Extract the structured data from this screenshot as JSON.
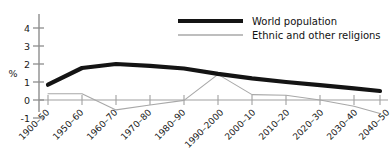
{
  "chart_data": {
    "type": "line",
    "title": "",
    "subtitle": "",
    "xlabel": "",
    "ylabel": "%",
    "categories": [
      "1900–50",
      "1950–60",
      "1960–70",
      "1970–80",
      "1980–90",
      "1990–2000",
      "2000–10",
      "2010–20",
      "2020–30",
      "2030–40",
      "2040–50"
    ],
    "series": [
      {
        "name": "World population",
        "color": "#141414",
        "line_width": 4.2,
        "values": [
          0.85,
          1.78,
          2.0,
          1.9,
          1.75,
          1.45,
          1.2,
          1.0,
          0.82,
          0.65,
          0.5
        ]
      },
      {
        "name": "Ethnic and other religions",
        "color": "#a8a8a8",
        "line_width": 1.1,
        "values": [
          0.35,
          0.35,
          -0.55,
          -0.28,
          -0.02,
          1.42,
          0.3,
          0.26,
          0.0,
          -0.35,
          -0.75
        ]
      }
    ],
    "yticks": [
      -1,
      0,
      1,
      2,
      3,
      4
    ],
    "ytick_labels": [
      "-1",
      "0",
      "1",
      "2",
      "3",
      "4"
    ],
    "ylim": [
      -1,
      4.4
    ],
    "grid": false,
    "zero_line": true,
    "legend": {
      "position": "top-right",
      "entries": [
        {
          "label": "World population",
          "swatch": "thick-black-line"
        },
        {
          "label": "Ethnic and other religions",
          "swatch": "thin-gray-line"
        }
      ]
    }
  },
  "colors": {
    "background": "#ffffff",
    "axis": "#9a9a9a",
    "text": "#1a1a1a",
    "series_world_population": "#141414",
    "series_ethnic_religions": "#a8a8a8"
  }
}
